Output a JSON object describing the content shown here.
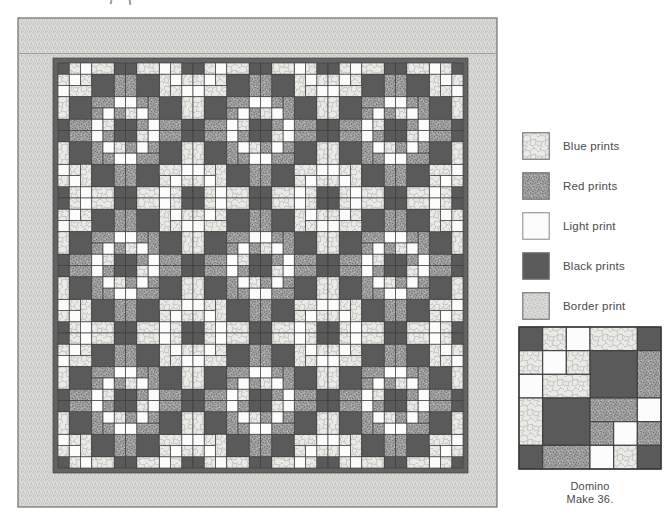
{
  "quilt": {
    "x": 18,
    "y": 18,
    "width": 479,
    "height": 489,
    "border_band_seam_y": 53.5,
    "inner_border_color": "#646464",
    "interior": {
      "x": 58,
      "y": 63,
      "size": 405,
      "cells_across": 36
    },
    "blocks_across": 6,
    "block_rotations": [
      [
        0,
        90,
        0,
        90,
        0,
        90
      ],
      [
        270,
        180,
        270,
        180,
        270,
        180
      ],
      [
        0,
        90,
        0,
        90,
        0,
        90
      ],
      [
        270,
        180,
        270,
        180,
        270,
        180
      ],
      [
        0,
        90,
        0,
        90,
        0,
        90
      ],
      [
        270,
        180,
        270,
        180,
        270,
        180
      ]
    ]
  },
  "block_pattern": {
    "grid": 6,
    "pieces": [
      [
        1,
        1,
        1,
        1,
        "K"
      ],
      [
        1,
        2,
        1,
        1,
        "B"
      ],
      [
        1,
        3,
        1,
        1,
        "W"
      ],
      [
        1,
        4,
        2,
        1,
        "B"
      ],
      [
        1,
        6,
        1,
        1,
        "K"
      ],
      [
        2,
        1,
        1,
        1,
        "B"
      ],
      [
        2,
        2,
        1,
        1,
        "W"
      ],
      [
        2,
        3,
        1,
        1,
        "B"
      ],
      [
        2,
        4,
        2,
        2,
        "K"
      ],
      [
        2,
        6,
        1,
        2,
        "R"
      ],
      [
        3,
        1,
        1,
        1,
        "W"
      ],
      [
        3,
        2,
        2,
        1,
        "B"
      ],
      [
        4,
        1,
        1,
        2,
        "B"
      ],
      [
        4,
        2,
        2,
        2,
        "K"
      ],
      [
        4,
        4,
        2,
        1,
        "R"
      ],
      [
        4,
        6,
        1,
        1,
        "W"
      ],
      [
        5,
        4,
        1,
        1,
        "R"
      ],
      [
        5,
        5,
        1,
        1,
        "W"
      ],
      [
        5,
        6,
        1,
        1,
        "R"
      ],
      [
        6,
        1,
        1,
        1,
        "K"
      ],
      [
        6,
        2,
        2,
        1,
        "R"
      ],
      [
        6,
        4,
        1,
        1,
        "W"
      ],
      [
        6,
        5,
        1,
        1,
        "B"
      ],
      [
        6,
        6,
        1,
        1,
        "K"
      ]
    ]
  },
  "fabrics": {
    "B": {
      "name": "Blue prints",
      "base": "#eaeae7",
      "detail": "#b2b2af",
      "texture": "crackle"
    },
    "R": {
      "name": "Red prints",
      "base": "#9f9f9f",
      "detail": "#6a6a6a",
      "light": "#c9c9c6",
      "texture": "speckle"
    },
    "W": {
      "name": "Light print",
      "base": "#fcfcfc",
      "texture": "solid"
    },
    "K": {
      "name": "Black prints",
      "base": "#5a5a5a",
      "texture": "solid"
    },
    "D": {
      "name": "Border print",
      "base": "#dbdbd8",
      "detail": "#a7a7a4",
      "light": "#c6c6c3",
      "texture": "speckle-fine"
    }
  },
  "seam": {
    "color": "#3f3f3f",
    "edge": "#6f6f6f"
  },
  "legend": {
    "items": [
      {
        "key": "B",
        "label": "Blue prints"
      },
      {
        "key": "R",
        "label": "Red prints"
      },
      {
        "key": "W",
        "label": "Light print"
      },
      {
        "key": "K",
        "label": "Black prints"
      },
      {
        "key": "D",
        "label": "Border print"
      }
    ]
  },
  "example_block": {
    "x": 519,
    "y": 327,
    "size": 142,
    "caption_line1": "Domino",
    "caption_line2": "Make 36."
  }
}
